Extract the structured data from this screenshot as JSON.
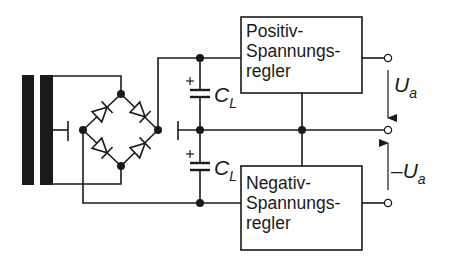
{
  "diagram": {
    "type": "circuit",
    "boxes": [
      {
        "id": "pos",
        "lines": [
          "Positiv-",
          "Spannungs-",
          "regler"
        ]
      },
      {
        "id": "neg",
        "lines": [
          "Negativ-",
          "Spannungs-",
          "regler"
        ]
      }
    ],
    "capacitors": [
      {
        "label": "C",
        "subscript": "L",
        "polarity": "+"
      },
      {
        "label": "C",
        "subscript": "L",
        "polarity": "+"
      }
    ],
    "outputs": [
      {
        "label": "U",
        "subscript": "a",
        "prefix": ""
      },
      {
        "label": "U",
        "subscript": "a",
        "prefix": "–"
      }
    ],
    "components": [
      "transformer",
      "bridge-rectifier (4 diodes)",
      "2x smoothing capacitor C_L",
      "positive voltage regulator",
      "negative voltage regulator",
      "3 output terminals"
    ],
    "colors": {
      "line": "#1a1a1a",
      "background": "#ffffff"
    }
  }
}
